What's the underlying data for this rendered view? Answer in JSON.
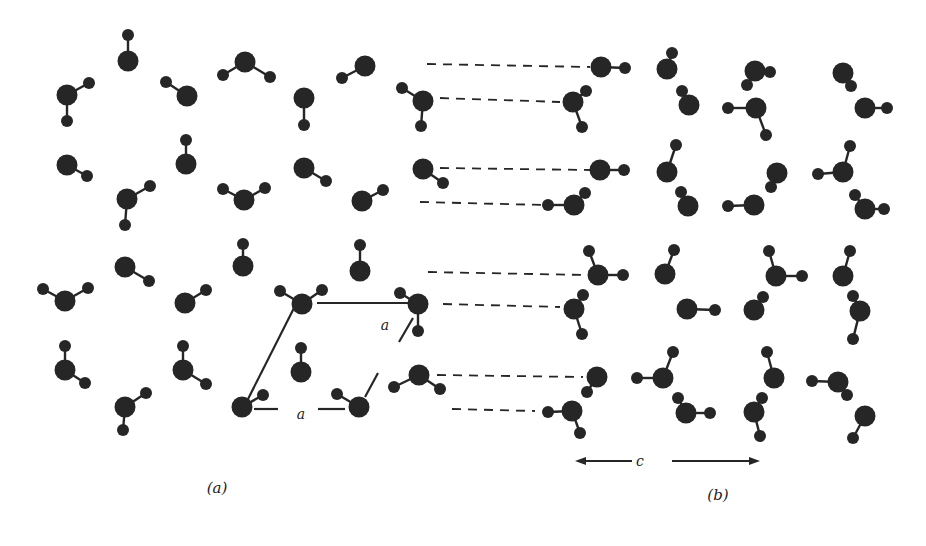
{
  "figure": {
    "colors": {
      "atom": "#262626",
      "bond": "#262626",
      "background": "#ffffff"
    },
    "panels": [
      {
        "id": "a",
        "caption": "(a)",
        "caption_pos": [
          217,
          488
        ]
      },
      {
        "id": "b",
        "caption": "(b)",
        "caption_pos": [
          718,
          495
        ]
      }
    ],
    "unit_cell": {
      "label_a_bottom": "a",
      "label_a_side": "a",
      "label_a_bottom_pos": [
        301,
        414
      ],
      "label_a_side_pos": [
        385,
        325
      ],
      "edges": [
        [
          [
            246,
            403
          ],
          [
            294,
            308
          ]
        ],
        [
          [
            317,
            303
          ],
          [
            411,
            303
          ]
        ],
        [
          [
            413,
            318
          ],
          [
            399,
            342
          ]
        ],
        [
          [
            378,
            373
          ],
          [
            365,
            397
          ]
        ],
        [
          [
            254,
            409
          ],
          [
            278,
            409
          ]
        ],
        [
          [
            318,
            409
          ],
          [
            345,
            409
          ]
        ]
      ]
    },
    "c_axis": {
      "label": "c",
      "pos": [
        640,
        461
      ],
      "left_arrow": [
        [
          575,
          461
        ],
        [
          632,
          461
        ]
      ],
      "right_arrow": [
        [
          672,
          461
        ],
        [
          760,
          461
        ]
      ]
    },
    "dashed_lines": [
      [
        [
          427,
          64
        ],
        [
          590,
          67
        ]
      ],
      [
        [
          440,
          98
        ],
        [
          560,
          102
        ]
      ],
      [
        [
          440,
          168
        ],
        [
          590,
          170
        ]
      ],
      [
        [
          420,
          202
        ],
        [
          545,
          205
        ]
      ],
      [
        [
          428,
          272
        ],
        [
          585,
          275
        ]
      ],
      [
        [
          443,
          304
        ],
        [
          560,
          307
        ]
      ],
      [
        [
          437,
          375
        ],
        [
          583,
          377
        ]
      ],
      [
        [
          452,
          409
        ],
        [
          535,
          411
        ]
      ]
    ],
    "molecules": [
      {
        "o": [
          128,
          61
        ],
        "h": [
          [
            128,
            35
          ]
        ]
      },
      {
        "o": [
          67,
          95
        ],
        "h": [
          [
            89,
            83
          ],
          [
            67,
            121
          ]
        ]
      },
      {
        "o": [
          187,
          96
        ],
        "h": [
          [
            166,
            82
          ]
        ]
      },
      {
        "o": [
          245,
          62
        ],
        "h": [
          [
            223,
            75
          ],
          [
            270,
            77
          ]
        ]
      },
      {
        "o": [
          365,
          66
        ],
        "h": [
          [
            342,
            78
          ]
        ]
      },
      {
        "o": [
          304,
          98
        ],
        "h": [
          [
            304,
            125
          ]
        ]
      },
      {
        "o": [
          423,
          101
        ],
        "h": [
          [
            402,
            88
          ],
          [
            421,
            126
          ]
        ]
      },
      {
        "o": [
          67,
          165
        ],
        "h": [
          [
            87,
            176
          ]
        ]
      },
      {
        "o": [
          127,
          199
        ],
        "h": [
          [
            150,
            186
          ],
          [
            125,
            225
          ]
        ]
      },
      {
        "o": [
          186,
          164
        ],
        "h": [
          [
            186,
            140
          ]
        ]
      },
      {
        "o": [
          244,
          200
        ],
        "h": [
          [
            223,
            189
          ],
          [
            265,
            188
          ]
        ]
      },
      {
        "o": [
          304,
          168
        ],
        "h": [
          [
            326,
            181
          ]
        ]
      },
      {
        "o": [
          362,
          201
        ],
        "h": [
          [
            383,
            190
          ]
        ]
      },
      {
        "o": [
          423,
          169
        ],
        "h": [
          [
            443,
            183
          ]
        ]
      },
      {
        "o": [
          65,
          301
        ],
        "h": [
          [
            43,
            289
          ],
          [
            88,
            288
          ]
        ]
      },
      {
        "o": [
          125,
          267
        ],
        "h": [
          [
            149,
            281
          ]
        ]
      },
      {
        "o": [
          185,
          303
        ],
        "h": [
          [
            206,
            290
          ]
        ]
      },
      {
        "o": [
          243,
          266
        ],
        "h": [
          [
            243,
            244
          ]
        ]
      },
      {
        "o": [
          360,
          271
        ],
        "h": [
          [
            360,
            245
          ]
        ]
      },
      {
        "o": [
          302,
          304
        ],
        "h": [
          [
            280,
            291
          ],
          [
            322,
            290
          ]
        ]
      },
      {
        "o": [
          418,
          304
        ],
        "h": [
          [
            400,
            293
          ],
          [
            418,
            331
          ]
        ]
      },
      {
        "o": [
          65,
          370
        ],
        "h": [
          [
            65,
            346
          ],
          [
            85,
            383
          ]
        ]
      },
      {
        "o": [
          183,
          370
        ],
        "h": [
          [
            183,
            346
          ],
          [
            206,
            384
          ]
        ]
      },
      {
        "o": [
          301,
          372
        ],
        "h": [
          [
            301,
            348
          ]
        ]
      },
      {
        "o": [
          125,
          407
        ],
        "h": [
          [
            146,
            393
          ],
          [
            123,
            430
          ]
        ]
      },
      {
        "o": [
          242,
          407
        ],
        "h": [
          [
            263,
            395
          ]
        ]
      },
      {
        "o": [
          359,
          407
        ],
        "h": [
          [
            337,
            394
          ]
        ]
      },
      {
        "o": [
          419,
          375
        ],
        "h": [
          [
            394,
            387
          ],
          [
            440,
            389
          ]
        ]
      },
      {
        "o": [
          601,
          67
        ],
        "h": [
          [
            625,
            68
          ]
        ]
      },
      {
        "o": [
          573,
          102
        ],
        "h": [
          [
            586,
            91
          ],
          [
            582,
            127
          ]
        ]
      },
      {
        "o": [
          600,
          170
        ],
        "h": [
          [
            624,
            170
          ]
        ]
      },
      {
        "o": [
          574,
          205
        ],
        "h": [
          [
            585,
            193
          ],
          [
            548,
            205
          ]
        ]
      },
      {
        "o": [
          598,
          275
        ],
        "h": [
          [
            589,
            251
          ],
          [
            623,
            275
          ]
        ]
      },
      {
        "o": [
          574,
          309
        ],
        "h": [
          [
            583,
            295
          ],
          [
            582,
            334
          ]
        ]
      },
      {
        "o": [
          597,
          377
        ],
        "h": [
          [
            587,
            392
          ]
        ]
      },
      {
        "o": [
          572,
          411
        ],
        "h": [
          [
            548,
            412
          ],
          [
            580,
            433
          ]
        ]
      },
      {
        "o": [
          667,
          69
        ],
        "h": [
          [
            672,
            53
          ]
        ]
      },
      {
        "o": [
          689,
          105
        ],
        "h": [
          [
            682,
            91
          ]
        ]
      },
      {
        "o": [
          667,
          172
        ],
        "h": [
          [
            676,
            145
          ]
        ]
      },
      {
        "o": [
          688,
          206
        ],
        "h": [
          [
            681,
            192
          ]
        ]
      },
      {
        "o": [
          665,
          274
        ],
        "h": [
          [
            674,
            250
          ]
        ]
      },
      {
        "o": [
          687,
          309
        ],
        "h": [
          [
            715,
            310
          ]
        ]
      },
      {
        "o": [
          663,
          378
        ],
        "h": [
          [
            637,
            378
          ],
          [
            673,
            352
          ]
        ]
      },
      {
        "o": [
          686,
          413
        ],
        "h": [
          [
            678,
            398
          ],
          [
            710,
            413
          ]
        ]
      },
      {
        "o": [
          755,
          71
        ],
        "h": [
          [
            770,
            72
          ],
          [
            747,
            85
          ]
        ]
      },
      {
        "o": [
          756,
          108
        ],
        "h": [
          [
            728,
            108
          ],
          [
            766,
            135
          ]
        ]
      },
      {
        "o": [
          777,
          173
        ],
        "h": [
          [
            771,
            187
          ]
        ]
      },
      {
        "o": [
          754,
          205
        ],
        "h": [
          [
            728,
            206
          ]
        ]
      },
      {
        "o": [
          776,
          276
        ],
        "h": [
          [
            769,
            251
          ],
          [
            802,
            276
          ]
        ]
      },
      {
        "o": [
          754,
          310
        ],
        "h": [
          [
            763,
            297
          ]
        ]
      },
      {
        "o": [
          774,
          378
        ],
        "h": [
          [
            767,
            352
          ]
        ]
      },
      {
        "o": [
          754,
          412
        ],
        "h": [
          [
            762,
            398
          ],
          [
            760,
            436
          ]
        ]
      },
      {
        "o": [
          843,
          73
        ],
        "h": [
          [
            851,
            86
          ]
        ]
      },
      {
        "o": [
          865,
          108
        ],
        "h": [
          [
            887,
            108
          ]
        ]
      },
      {
        "o": [
          843,
          172
        ],
        "h": [
          [
            850,
            146
          ],
          [
            818,
            174
          ]
        ]
      },
      {
        "o": [
          865,
          209
        ],
        "h": [
          [
            855,
            195
          ],
          [
            884,
            209
          ]
        ]
      },
      {
        "o": [
          843,
          276
        ],
        "h": [
          [
            850,
            251
          ]
        ]
      },
      {
        "o": [
          860,
          311
        ],
        "h": [
          [
            853,
            296
          ],
          [
            853,
            339
          ]
        ]
      },
      {
        "o": [
          838,
          382
        ],
        "h": [
          [
            812,
            381
          ],
          [
            847,
            395
          ]
        ]
      },
      {
        "o": [
          865,
          416
        ],
        "h": [
          [
            853,
            438
          ]
        ]
      }
    ]
  }
}
